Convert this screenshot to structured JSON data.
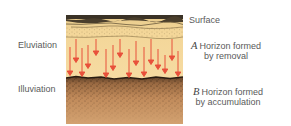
{
  "diagram": {
    "type": "soil-profile",
    "left_labels": {
      "eluviation": "Eluviation",
      "illuviation": "Illuviation"
    },
    "right_labels": {
      "surface": "Surface",
      "a_horizon": {
        "letter": "A",
        "line1": "Horizon formed",
        "line2": "by removal"
      },
      "b_horizon": {
        "letter": "B",
        "line1": "Horizon formed",
        "line2": "by accumulation"
      }
    },
    "colors": {
      "surface_dark": "#3a3226",
      "a_horizon": "#f4d79c",
      "a_horizon_top": "#e9cc8e",
      "b_horizon_top": "#6b4a30",
      "b_horizon": "#c8915f",
      "b_horizon_bottom": "#d4a070",
      "arrow": "#e8503a"
    },
    "arrows": {
      "count": 15,
      "direction": "down"
    }
  }
}
